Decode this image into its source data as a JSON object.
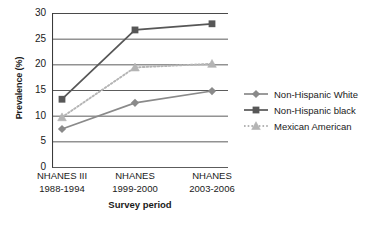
{
  "chart_data": {
    "type": "line",
    "title": "",
    "xlabel": "Survey period",
    "ylabel": "Prevalence (%)",
    "categories": [
      "NHANES III\n1988-1994",
      "NHANES\n1999-2000",
      "NHANES\n2003-2006"
    ],
    "category_lines": [
      [
        "NHANES III",
        "1988-1994"
      ],
      [
        "NHANES",
        "1999-2000"
      ],
      [
        "NHANES",
        "2003-2006"
      ]
    ],
    "ylim": [
      0,
      30
    ],
    "yticks": [
      30,
      25,
      20,
      15,
      10,
      5,
      0
    ],
    "grid": "horizontal",
    "legend_position": "right",
    "series": [
      {
        "name": "Non-Hispanic White",
        "values": [
          7.4,
          12.5,
          14.8
        ],
        "color": "#8a8a8a",
        "marker": "diamond",
        "linestyle": "solid"
      },
      {
        "name": "Non-Hispanic black",
        "values": [
          13.2,
          26.7,
          27.9
        ],
        "color": "#575757",
        "marker": "square",
        "linestyle": "solid"
      },
      {
        "name": "Mexican American",
        "values": [
          9.7,
          19.4,
          20.1
        ],
        "color": "#b4b4b4",
        "marker": "triangle",
        "linestyle": "dotted"
      }
    ]
  },
  "axis": {
    "ylabel": "Prevalence (%)",
    "xlabel": "Survey period",
    "yticks": [
      "30",
      "25",
      "20",
      "15",
      "10",
      "5",
      "0"
    ]
  },
  "legend": {
    "items": [
      {
        "label": "Non-Hispanic White"
      },
      {
        "label": "Non-Hispanic black"
      },
      {
        "label": "Mexican American"
      }
    ]
  }
}
